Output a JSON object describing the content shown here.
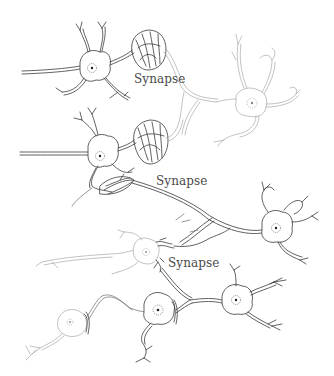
{
  "figure": {
    "labels": [
      {
        "id": "synapse-1",
        "text": "Synapse",
        "x": 134,
        "y": 73
      },
      {
        "id": "synapse-2",
        "text": "Synapse",
        "x": 156,
        "y": 175
      },
      {
        "id": "synapse-3",
        "text": "Synapse",
        "x": 168,
        "y": 257
      }
    ],
    "colors": {
      "background": "#ffffff",
      "dark_line": "#3a3a3a",
      "light_line": "#a8a8a8",
      "label_text": "#4a4a4a"
    }
  }
}
